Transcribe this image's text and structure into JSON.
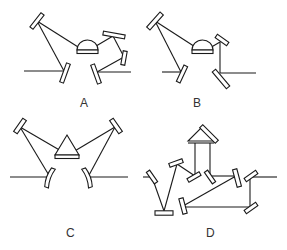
{
  "diagram": {
    "type": "optical-resonator-configurations",
    "panels": [
      {
        "id": "A",
        "label": "A",
        "description": "Ring cavity with hemispherical crystal, four folding mirrors plus input/output couplers"
      },
      {
        "id": "B",
        "label": "B",
        "description": "Ring cavity with hemispherical crystal, three folding mirrors plus input/output couplers"
      },
      {
        "id": "C",
        "label": "C",
        "description": "Symmetric cavity with triangular prism crystal, two curved end mirrors and two couplers"
      },
      {
        "id": "D",
        "label": "D",
        "description": "Folded cavity with roof prism retro-reflector and multiple plane mirrors"
      }
    ],
    "colors": {
      "line": "#1a1a1a",
      "background": "#ffffff",
      "label": "#333333"
    }
  }
}
